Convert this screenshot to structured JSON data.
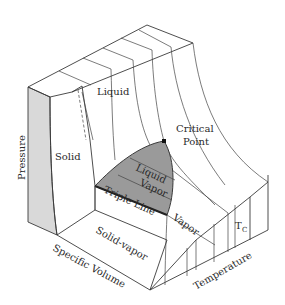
{
  "diagram": {
    "type": "P-v-T surface",
    "colors": {
      "background": "#ffffff",
      "line": "#3a3a3a",
      "two_phase_region": "#9a9a9a",
      "side_face": "#d9d9d9",
      "critical_point": "#111111"
    },
    "axes": {
      "vertical": "Pressure",
      "left_bottom": "Specific Volume",
      "right_bottom": "Temperature"
    },
    "regions": {
      "solid": "Solid",
      "liquid": "Liquid",
      "liquid_vapor_top": "Liquid",
      "liquid_vapor_bottom": "Vapor",
      "triple_line": "Triple Line",
      "solid_vapor": "Solid-vapor",
      "vapor": "Vapor"
    },
    "annotations": {
      "critical_point_line1": "Critical",
      "critical_point_line2": "Point",
      "tc_main": "T",
      "tc_sub": "C"
    }
  }
}
